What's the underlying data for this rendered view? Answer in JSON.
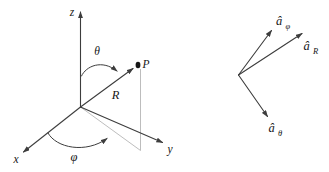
{
  "figure": {
    "left_diagram": {
      "z_axis_label": "z",
      "x_axis_label": "x",
      "y_axis_label": "y",
      "theta_angle_label": "θ",
      "phi_angle_label": "φ",
      "radius_label": "R",
      "point_label": "P"
    },
    "right_diagram": {
      "unit_vector_phi": {
        "base": "â",
        "sub": "φ"
      },
      "unit_vector_R": {
        "base": "â",
        "sub": "R"
      },
      "unit_vector_theta": {
        "base": "â",
        "sub": "θ"
      }
    }
  },
  "colors": {
    "stroke": "#3d3d3d",
    "light_stroke": "#b5b5b5",
    "text": "#161616",
    "background": "#ffffff"
  }
}
